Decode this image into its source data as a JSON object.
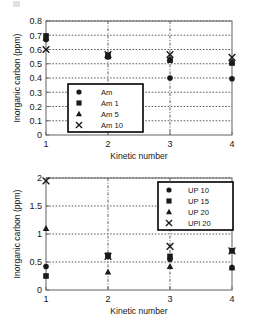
{
  "chart_data": [
    {
      "type": "scatter",
      "title": "",
      "xlabel": "Kinetic number",
      "ylabel": "Inorganic carbon (ppm)",
      "x": [
        1,
        2,
        3,
        4
      ],
      "xticklabels": [
        "1",
        "2",
        "3",
        "4"
      ],
      "xlim": [
        1,
        4
      ],
      "ylim": [
        0,
        0.8
      ],
      "yticklabels": [
        "0",
        "0.1",
        "0.2",
        "0.3",
        "0.4",
        "0.5",
        "0.6",
        "0.7",
        "0.8"
      ],
      "ytickvalues": [
        0,
        0.1,
        0.2,
        0.3,
        0.4,
        0.5,
        0.6,
        0.7,
        0.8
      ],
      "grid": "dotted-horizontal-and-vertical",
      "legend_position": "lower-left-inside",
      "series": [
        {
          "name": "Am",
          "marker": "circle",
          "values": [
            0.67,
            0.55,
            0.4,
            0.395
          ]
        },
        {
          "name": "Am 1",
          "marker": "square",
          "values": [
            0.695,
            0.56,
            0.525,
            0.505
          ]
        },
        {
          "name": "Am 5",
          "marker": "triangle",
          "values": [
            0.68,
            0.55,
            0.535,
            0.515
          ]
        },
        {
          "name": "Am 10",
          "marker": "cross",
          "values": [
            0.6,
            0.565,
            0.565,
            0.545
          ]
        }
      ]
    },
    {
      "type": "scatter",
      "title": "",
      "xlabel": "Kinetic number",
      "ylabel": "Inorganic carbon (ppm)",
      "x": [
        1,
        2,
        3,
        4
      ],
      "xticklabels": [
        "1",
        "2",
        "3",
        "4"
      ],
      "xlim": [
        1,
        4
      ],
      "ylim": [
        0,
        2
      ],
      "yticklabels": [
        "0",
        "0.5",
        "1",
        "1.5",
        "2"
      ],
      "ytickvalues": [
        0,
        0.5,
        1,
        1.5,
        2
      ],
      "grid": "dotted-horizontal-and-vertical",
      "legend_position": "upper-right-inside",
      "series": [
        {
          "name": "UP 10",
          "marker": "circle",
          "values": [
            0.42,
            0.6,
            0.55,
            0.4
          ]
        },
        {
          "name": "UP 15",
          "marker": "square",
          "values": [
            0.25,
            0.62,
            0.6,
            0.7
          ]
        },
        {
          "name": "UP 20",
          "marker": "triangle",
          "values": [
            1.1,
            0.32,
            0.42,
            0.4
          ]
        },
        {
          "name": "UPl 20",
          "marker": "cross",
          "values": [
            1.95,
            0.6,
            0.78,
            0.7
          ]
        }
      ]
    }
  ],
  "colors": {
    "axis": "#6f6f6f",
    "marker": "#1a1a1a",
    "grid": "#4d4d4d",
    "legend_border": "#000000",
    "background": "#ffffff"
  }
}
